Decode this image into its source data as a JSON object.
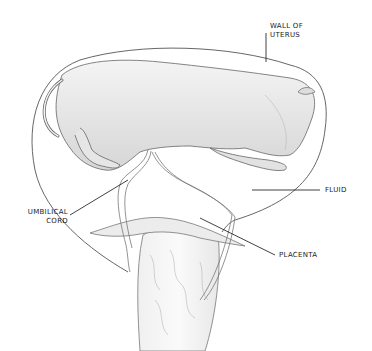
{
  "diagram": {
    "labels": [
      {
        "id": "wall",
        "text_line1": "WALL OF",
        "text_line2": "UTERUS"
      },
      {
        "id": "fluid",
        "text": "FLUID"
      },
      {
        "id": "umbilical",
        "text_line1": "UMBILICAL",
        "text_line2": "CORD"
      },
      {
        "id": "placenta",
        "text": "PLACENTA"
      }
    ],
    "colors": {
      "background": "#ffffff",
      "line": "#555555",
      "shade": "#d9d9d9",
      "leader": "#111111"
    }
  }
}
